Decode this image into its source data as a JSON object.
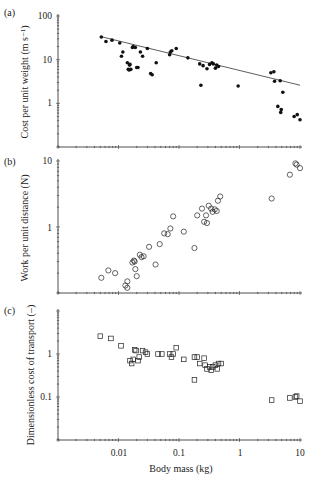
{
  "figure": {
    "xlabel": "Body mass (kg)",
    "xticks": [
      "0.01",
      "0.1",
      "1",
      "10"
    ],
    "xlim": [
      0.001,
      10
    ]
  },
  "chart_data": [
    {
      "panel": "(a)",
      "type": "scatter",
      "marker": "filled-circle",
      "ylabel": "Cost per unit weight (m s⁻¹)",
      "xlabel": "Body mass (kg)",
      "yscale": "log",
      "xscale": "log",
      "ylim": [
        0.1,
        100
      ],
      "yticks": [
        "100",
        "10",
        "1"
      ],
      "xlim": [
        0.001,
        10
      ],
      "fit_line": {
        "x": [
          0.005,
          10
        ],
        "y": [
          34,
          2.6
        ]
      },
      "points": [
        [
          0.0052,
          33
        ],
        [
          0.0062,
          26
        ],
        [
          0.0078,
          28
        ],
        [
          0.0105,
          24
        ],
        [
          0.0112,
          12
        ],
        [
          0.0118,
          15
        ],
        [
          0.014,
          8.5
        ],
        [
          0.0145,
          6
        ],
        [
          0.015,
          5.8
        ],
        [
          0.0152,
          7.5
        ],
        [
          0.0155,
          7.8
        ],
        [
          0.016,
          6
        ],
        [
          0.017,
          19
        ],
        [
          0.0175,
          20
        ],
        [
          0.019,
          19
        ],
        [
          0.02,
          6.6
        ],
        [
          0.021,
          6.6
        ],
        [
          0.023,
          15
        ],
        [
          0.025,
          12
        ],
        [
          0.03,
          18
        ],
        [
          0.034,
          4.8
        ],
        [
          0.036,
          4.5
        ],
        [
          0.042,
          8.5
        ],
        [
          0.07,
          13
        ],
        [
          0.072,
          15
        ],
        [
          0.076,
          16
        ],
        [
          0.09,
          18
        ],
        [
          0.14,
          11
        ],
        [
          0.22,
          8
        ],
        [
          0.23,
          2.6
        ],
        [
          0.25,
          7.3
        ],
        [
          0.29,
          6.2
        ],
        [
          0.32,
          7.8
        ],
        [
          0.35,
          8.5
        ],
        [
          0.37,
          8
        ],
        [
          0.4,
          6.4
        ],
        [
          0.42,
          7.5
        ],
        [
          0.45,
          7
        ],
        [
          0.95,
          2.5
        ],
        [
          3.3,
          5
        ],
        [
          3.7,
          5.3
        ],
        [
          3.8,
          3.2
        ],
        [
          4.7,
          3.3
        ],
        [
          5.2,
          1.8
        ],
        [
          4.3,
          0.85
        ],
        [
          4.9,
          0.72
        ],
        [
          4.8,
          0.62
        ],
        [
          8.0,
          0.5
        ],
        [
          9.0,
          0.55
        ],
        [
          10.0,
          0.42
        ]
      ]
    },
    {
      "panel": "(b)",
      "type": "scatter",
      "marker": "open-circle",
      "ylabel": "Work per unit distance (N)",
      "xlabel": "Body mass (kg)",
      "yscale": "log",
      "xscale": "log",
      "ylim": [
        0.1,
        10
      ],
      "yticks": [
        "10",
        "1"
      ],
      "xlim": [
        0.001,
        10
      ],
      "points": [
        [
          0.0052,
          0.17
        ],
        [
          0.0068,
          0.22
        ],
        [
          0.0088,
          0.2
        ],
        [
          0.013,
          0.13
        ],
        [
          0.014,
          0.12
        ],
        [
          0.014,
          0.15
        ],
        [
          0.017,
          0.29
        ],
        [
          0.018,
          0.31
        ],
        [
          0.0185,
          0.3
        ],
        [
          0.019,
          0.23
        ],
        [
          0.02,
          0.18
        ],
        [
          0.0225,
          0.38
        ],
        [
          0.024,
          0.35
        ],
        [
          0.026,
          0.36
        ],
        [
          0.032,
          0.5
        ],
        [
          0.041,
          0.27
        ],
        [
          0.048,
          0.55
        ],
        [
          0.057,
          0.8
        ],
        [
          0.065,
          0.78
        ],
        [
          0.072,
          0.95
        ],
        [
          0.08,
          1.45
        ],
        [
          0.12,
          0.85
        ],
        [
          0.18,
          0.48
        ],
        [
          0.2,
          1.5
        ],
        [
          0.24,
          1.9
        ],
        [
          0.26,
          1.2
        ],
        [
          0.28,
          1.5
        ],
        [
          0.29,
          1.15
        ],
        [
          0.31,
          2.1
        ],
        [
          0.34,
          1.9
        ],
        [
          0.36,
          1.7
        ],
        [
          0.39,
          1.85
        ],
        [
          0.42,
          1.75
        ],
        [
          0.44,
          2.5
        ],
        [
          0.48,
          2.9
        ],
        [
          3.4,
          2.7
        ],
        [
          6.8,
          6.2
        ],
        [
          8.4,
          9.2
        ],
        [
          8.8,
          8.8
        ],
        [
          10.0,
          7.8
        ]
      ]
    },
    {
      "panel": "(c)",
      "type": "scatter",
      "marker": "open-square",
      "ylabel": "Dimensionless cost of transport (–)",
      "xlabel": "Body mass (kg)",
      "yscale": "log",
      "xscale": "log",
      "ylim": [
        0.01,
        10
      ],
      "yticks": [
        "1",
        "0.1"
      ],
      "xticks": [
        "0.01",
        "0.1",
        "1",
        "10"
      ],
      "xlim": [
        0.001,
        10
      ],
      "points": [
        [
          0.005,
          2.6
        ],
        [
          0.0075,
          2.3
        ],
        [
          0.011,
          1.55
        ],
        [
          0.0155,
          0.7
        ],
        [
          0.0165,
          0.6
        ],
        [
          0.0175,
          0.75
        ],
        [
          0.0185,
          1.25
        ],
        [
          0.0195,
          1.2
        ],
        [
          0.021,
          0.7
        ],
        [
          0.022,
          0.85
        ],
        [
          0.025,
          1.2
        ],
        [
          0.028,
          1.1
        ],
        [
          0.03,
          1.0
        ],
        [
          0.045,
          1.0
        ],
        [
          0.052,
          1.0
        ],
        [
          0.07,
          1.0
        ],
        [
          0.075,
          0.85
        ],
        [
          0.08,
          1.0
        ],
        [
          0.09,
          1.4
        ],
        [
          0.12,
          0.75
        ],
        [
          0.18,
          0.85
        ],
        [
          0.2,
          0.85
        ],
        [
          0.22,
          0.6
        ],
        [
          0.26,
          0.8
        ],
        [
          0.27,
          0.55
        ],
        [
          0.29,
          0.45
        ],
        [
          0.32,
          0.5
        ],
        [
          0.34,
          0.42
        ],
        [
          0.36,
          0.5
        ],
        [
          0.4,
          0.55
        ],
        [
          0.43,
          0.45
        ],
        [
          0.45,
          0.6
        ],
        [
          0.5,
          0.6
        ],
        [
          0.18,
          0.25
        ],
        [
          3.4,
          0.085
        ],
        [
          6.8,
          0.095
        ],
        [
          8.4,
          0.1
        ],
        [
          8.8,
          0.105
        ],
        [
          10.0,
          0.08
        ]
      ]
    }
  ]
}
